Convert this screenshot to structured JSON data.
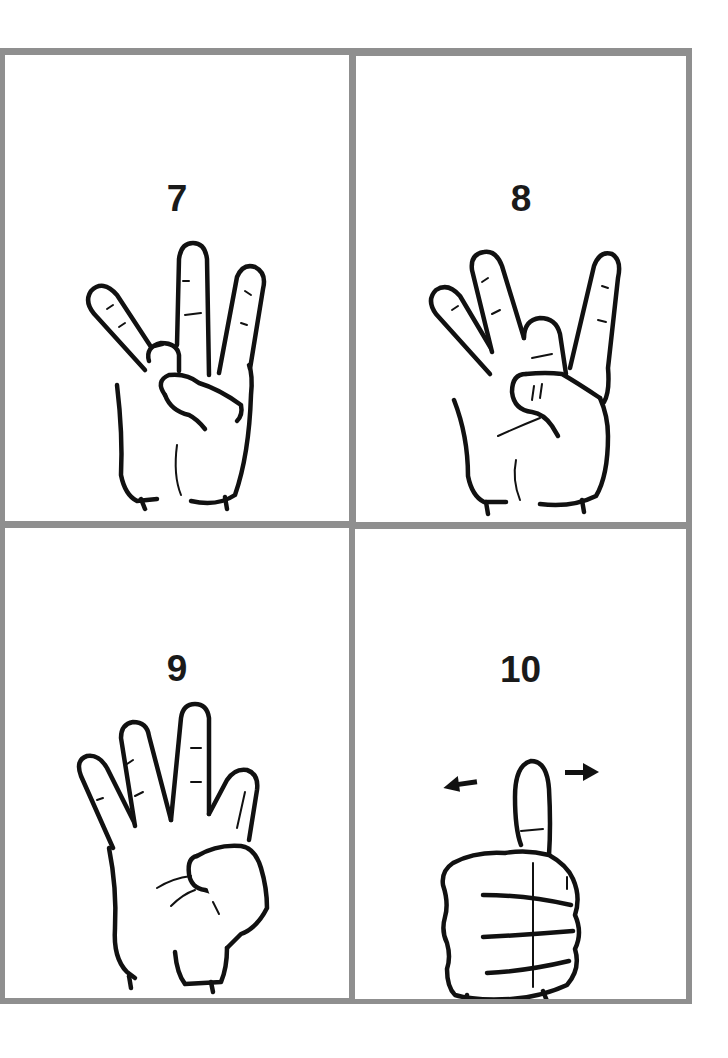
{
  "sheet": {
    "border_color": "#8f8f8f",
    "background": "#ffffff",
    "text_color": "#1a1a1a"
  },
  "cards": [
    {
      "label": "7",
      "illustration": "hand-sign-seven-icon"
    },
    {
      "label": "8",
      "illustration": "hand-sign-eight-icon"
    },
    {
      "label": "9",
      "illustration": "hand-sign-nine-icon"
    },
    {
      "label": "10",
      "illustration": "hand-sign-ten-thumb-shake-icon"
    }
  ]
}
